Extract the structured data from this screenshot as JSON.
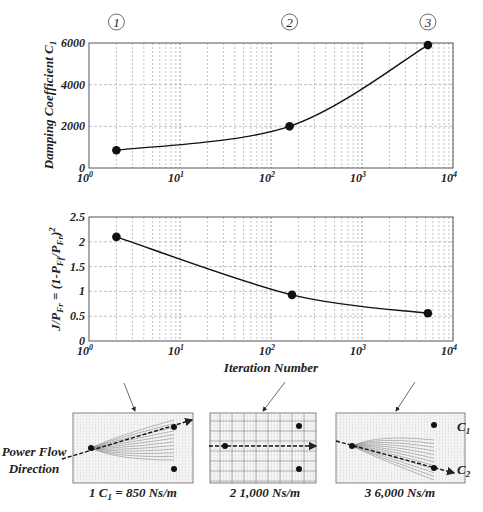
{
  "figure": {
    "markers": [
      {
        "label": "1",
        "x_iter": 2
      },
      {
        "label": "2",
        "x_iter": 160
      },
      {
        "label": "3",
        "x_iter": 5300
      }
    ],
    "panels": [
      {
        "number": "1",
        "caption": "C₁ = 850 Ns/m",
        "label_prefix": "1",
        "value_text": "= 850 Ns/m",
        "sym": "C",
        "sub": "1"
      },
      {
        "number": "2",
        "caption": "1,000 Ns/m",
        "label_prefix": "2",
        "value_text": "1,000 Ns/m"
      },
      {
        "number": "3",
        "caption": "6,000 Ns/m",
        "label_prefix": "3",
        "value_text": "6,000 Ns/m"
      }
    ],
    "annotations": {
      "power_flow_line1": "Power Flow",
      "power_flow_line2": "Direction",
      "c1_label": "C",
      "c1_sub": "1",
      "c2_label": "C",
      "c2_sub": "2"
    }
  },
  "chart_data": [
    {
      "type": "line",
      "title": "",
      "xlabel": "",
      "ylabel": "Damping Coefficient C1",
      "xscale": "log",
      "xlim": [
        1,
        10000
      ],
      "ylim": [
        0,
        6000
      ],
      "xticks": [
        "10^0",
        "10^1",
        "10^2",
        "10^3",
        "10^4"
      ],
      "yticks": [
        0,
        2000,
        4000,
        6000
      ],
      "grid": true,
      "series": [
        {
          "name": "C1",
          "x": [
            2,
            160,
            5300
          ],
          "y": [
            850,
            2000,
            5900
          ],
          "markers": true
        }
      ]
    },
    {
      "type": "line",
      "title": "",
      "xlabel": "Iteration Number",
      "ylabel": "J/P_Fr = (1-P_Ff/P_Fr)^2",
      "xscale": "log",
      "xlim": [
        1,
        10000
      ],
      "ylim": [
        0,
        2.5
      ],
      "xticks": [
        "10^0",
        "10^1",
        "10^2",
        "10^3",
        "10^4"
      ],
      "yticks": [
        0,
        0.5,
        1,
        1.5,
        2,
        2.5
      ],
      "grid": true,
      "series": [
        {
          "name": "J/P_Fr",
          "x": [
            2,
            170,
            5300
          ],
          "y": [
            2.1,
            0.93,
            0.56
          ],
          "markers": true
        }
      ]
    }
  ],
  "labels": {
    "top_ylabel_main": "Damping Coefficient C",
    "top_ylabel_sub": "1",
    "bottom_ylabel": "J/P",
    "bottom_xlabel": "Iteration Number",
    "yticks_top": [
      "0",
      "2000",
      "4000",
      "6000"
    ],
    "yticks_bottom": [
      "0",
      "0.5",
      "1",
      "1.5",
      "2",
      "2.5"
    ],
    "xtick_base": "10",
    "xtick_exps": [
      "0",
      "1",
      "2",
      "3",
      "4"
    ]
  }
}
